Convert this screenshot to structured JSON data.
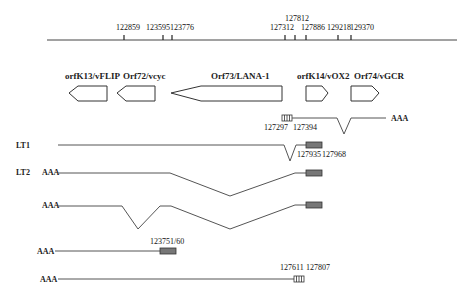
{
  "genome_axis": {
    "ticks": [
      {
        "label": "122859",
        "x": 124
      },
      {
        "label": "123595",
        "x": 163
      },
      {
        "label": "123776",
        "x": 172
      },
      {
        "label": "127312",
        "x": 285
      },
      {
        "label": "127812",
        "x": 295
      },
      {
        "label": "127886",
        "x": 306
      },
      {
        "label": "129218",
        "x": 338
      },
      {
        "label": "129370",
        "x": 351
      }
    ]
  },
  "orfs": [
    {
      "label": "orfK13/vFLIP",
      "direction": "left"
    },
    {
      "label": "Orf72/vcyc",
      "direction": "left"
    },
    {
      "label": "Orf73/LANA-1",
      "direction": "left"
    },
    {
      "label": "orfK14/vOX2",
      "direction": "right"
    },
    {
      "label": "Orf74/vGCR",
      "direction": "right"
    }
  ],
  "transcripts": {
    "top": {
      "coord_left": "127297",
      "coord_right": "127394",
      "tail": "AAA"
    },
    "lt1": {
      "label": "LT1",
      "coord_left": "127935",
      "coord_right": "127968"
    },
    "lt2": {
      "label": "LT2",
      "tail": "AAA"
    },
    "t3": {
      "tail": "AAA"
    },
    "t4": {
      "tail": "AAA",
      "coord": "123751/60"
    },
    "t5": {
      "tail": "AAA",
      "coord_left": "127611",
      "coord_right": "127807"
    }
  }
}
